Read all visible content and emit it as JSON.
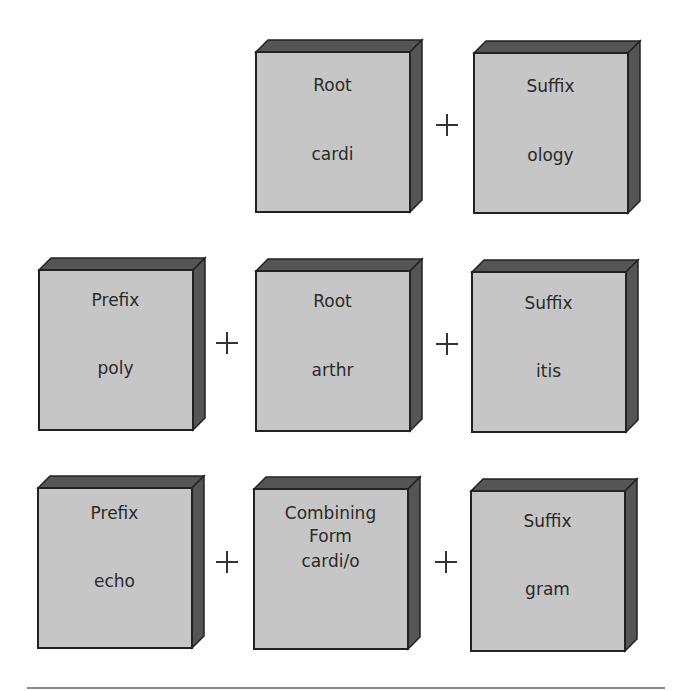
{
  "diagram": {
    "rows": [
      {
        "parts": [
          {
            "type": "Root",
            "value": "cardi"
          },
          {
            "type": "Suffix",
            "value": "ology"
          }
        ],
        "operator": "+"
      },
      {
        "parts": [
          {
            "type": "Prefix",
            "value": "poly"
          },
          {
            "type": "Root",
            "value": "arthr"
          },
          {
            "type": "Suffix",
            "value": "itis"
          }
        ],
        "operator": "+"
      },
      {
        "parts": [
          {
            "type": "Prefix",
            "value": "echo"
          },
          {
            "type": "Combining Form",
            "type_line1": "Combining",
            "type_line2": "Form",
            "value": "cardi/o"
          },
          {
            "type": "Suffix",
            "value": "gram"
          }
        ],
        "operator": "+"
      }
    ]
  },
  "colors": {
    "face": "#c6c6c6",
    "side": "#555555",
    "edge": "#222222",
    "text": "#2a2a2a",
    "divider": "#8a8a8a"
  }
}
